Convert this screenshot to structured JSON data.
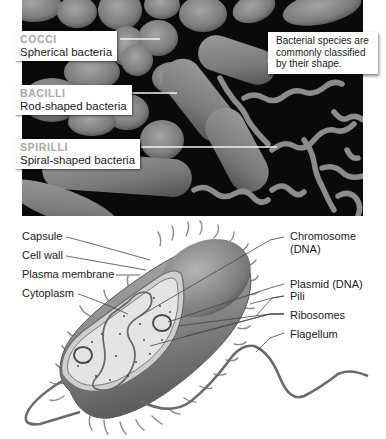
{
  "photo": {
    "description": "Scanning electron micrograph of bacteria on black background",
    "labels": [
      {
        "heading": "COCCI",
        "description": "Spherical bacteria"
      },
      {
        "heading": "BACILLI",
        "description": "Rod-shaped bacteria"
      },
      {
        "heading": "SPIRILLI",
        "description": "Spiral-shaped bacteria"
      }
    ],
    "callout": "Bacterial species are commonly classified by their shape."
  },
  "diagram": {
    "left_labels": [
      {
        "text": "Capsule"
      },
      {
        "text": "Cell wall"
      },
      {
        "text": "Plasma membrane"
      },
      {
        "text": "Cytoplasm"
      }
    ],
    "right_labels": [
      {
        "text": "Chromosome (DNA)"
      },
      {
        "text": "Plasmid (DNA)"
      },
      {
        "text": "Pili"
      },
      {
        "text": "Ribosomes"
      },
      {
        "text": "Flagellum"
      }
    ]
  },
  "colors": {
    "photo_bg": "#0a0a0a",
    "bacteria_gray": "#8a8a8a",
    "label_heading": "#a8a8a8",
    "label_text": "#1a1a1a",
    "cell_body": "#9a9a9a",
    "cytoplasm": "#e2e2e2"
  }
}
